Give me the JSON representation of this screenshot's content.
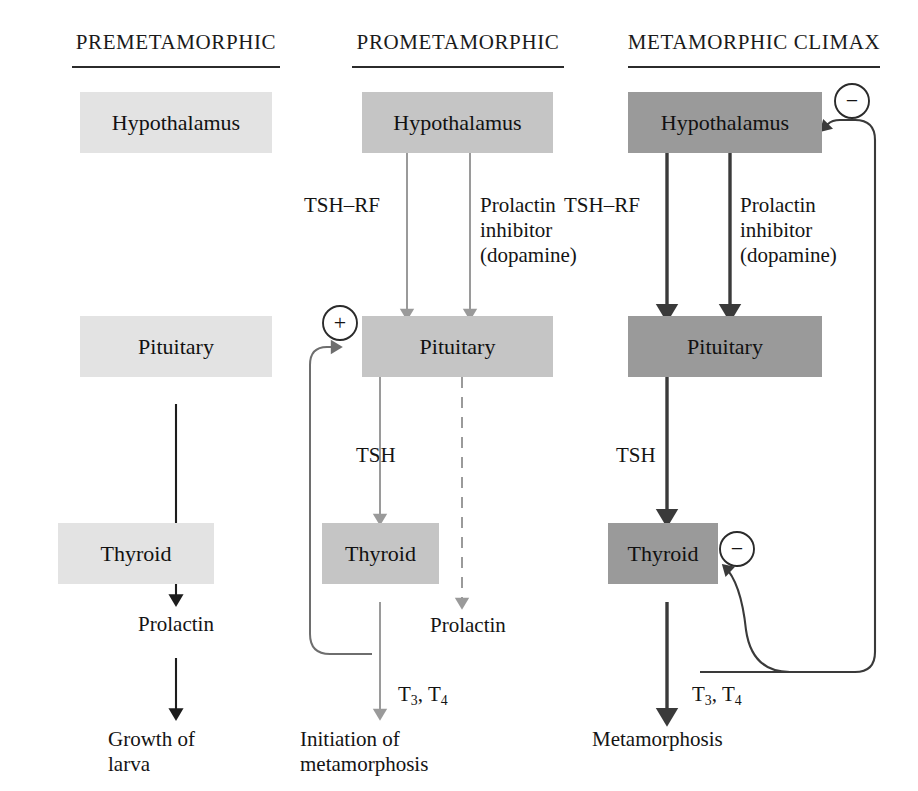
{
  "figure": {
    "type": "flow-diagram",
    "columns": [
      {
        "id": "premetamorphic",
        "title": "PREMETAMORPHIC",
        "shade": "#e3e3e3",
        "nodes": [
          "Hypothalamus",
          "Pituitary",
          "Thyroid"
        ],
        "edge_labels": [
          "Prolactin"
        ],
        "outcome": "Growth of\nlarva"
      },
      {
        "id": "prometamorphic",
        "title": "PROMETAMORPHIC",
        "shade": "#c5c5c5",
        "nodes": [
          "Hypothalamus",
          "Pituitary",
          "Thyroid"
        ],
        "edge_labels": [
          "TSH–RF",
          "Prolactin\ninhibitor\n(dopamine)",
          "TSH",
          "Prolactin",
          "T3, T4"
        ],
        "feedback": "+",
        "outcome": "Initiation of\nmetamorphosis"
      },
      {
        "id": "metamorphic-climax",
        "title": "METAMORPHIC CLIMAX",
        "shade": "#9a9a9a",
        "nodes": [
          "Hypothalamus",
          "Pituitary",
          "Thyroid"
        ],
        "edge_labels": [
          "TSH–RF",
          "Prolactin\ninhibitor\n(dopamine)",
          "TSH",
          "T3, T4"
        ],
        "feedback": [
          "−",
          "−"
        ],
        "outcome": "Metamorphosis"
      }
    ]
  },
  "c1": {
    "title": "PREMETAMORPHIC",
    "hypothalamus": "Hypothalamus",
    "pituitary": "Pituitary",
    "thyroid": "Thyroid",
    "prolactin": "Prolactin",
    "outcome": "Growth of\nlarva"
  },
  "c2": {
    "title": "PROMETAMORPHIC",
    "hypothalamus": "Hypothalamus",
    "pituitary": "Pituitary",
    "thyroid": "Thyroid",
    "tshrf": "TSH–RF",
    "inhibitor": "Prolactin\ninhibitor\n(dopamine)",
    "tsh": "TSH",
    "prolactin": "Prolactin",
    "t3t4_main": "T",
    "t3t4_sub1": "3",
    "t3t4_mid": ", T",
    "t3t4_sub2": "4",
    "plus": "+",
    "outcome": "Initiation of\nmetamorphosis"
  },
  "c3": {
    "title": "METAMORPHIC CLIMAX",
    "hypothalamus": "Hypothalamus",
    "pituitary": "Pituitary",
    "thyroid": "Thyroid",
    "tshrf": "TSH–RF",
    "inhibitor": "Prolactin\ninhibitor\n(dopamine)",
    "tsh": "TSH",
    "t3t4_main": "T",
    "t3t4_sub1": "3",
    "t3t4_mid": ", T",
    "t3t4_sub2": "4",
    "minus_top": "−",
    "minus_thyroid": "−",
    "outcome": "Metamorphosis"
  }
}
